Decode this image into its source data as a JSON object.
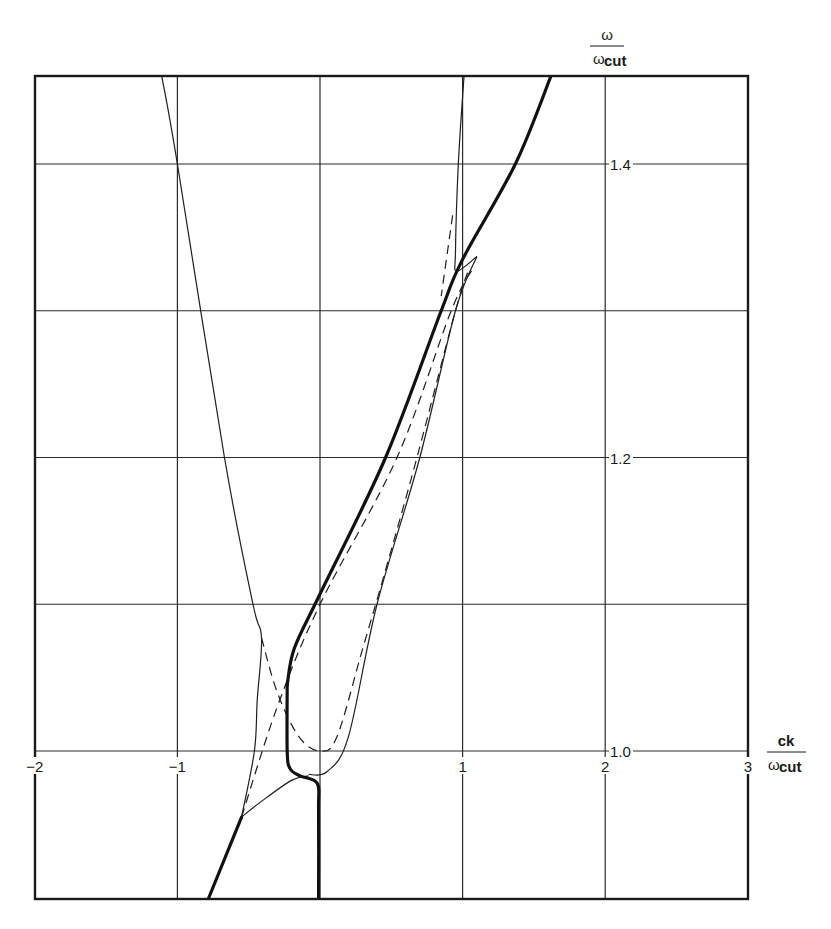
{
  "chart_data": {
    "type": "line",
    "title": "",
    "xlabel": "ck / ω_cut",
    "ylabel": "ω / ω_cut",
    "xlabel_parts": {
      "numerator": "ck",
      "denominator_symbol": "ω",
      "denominator_sub": "cut"
    },
    "ylabel_parts": {
      "numerator": "ω",
      "denominator_symbol": "ω",
      "denominator_sub": "cut"
    },
    "xlim": [
      -2,
      3
    ],
    "ylim": [
      0.9,
      1.46
    ],
    "grid": true,
    "x_ticks": [
      {
        "value": -2,
        "label": "−2"
      },
      {
        "value": -1,
        "label": "−1"
      },
      {
        "value": 0,
        "label": ""
      },
      {
        "value": 1,
        "label": "1"
      },
      {
        "value": 2,
        "label": "2"
      },
      {
        "value": 3,
        "label": "3"
      }
    ],
    "y_ticks": [
      {
        "value": 1.0,
        "label": "1.0"
      },
      {
        "value": 1.1,
        "label": ""
      },
      {
        "value": 1.2,
        "label": "1.2"
      },
      {
        "value": 1.3,
        "label": ""
      },
      {
        "value": 1.4,
        "label": "1.4"
      }
    ],
    "legend": null,
    "series": [
      {
        "name": "thick branch (upper light line)",
        "style": "thick",
        "points": [
          [
            -0.23,
            1.045
          ],
          [
            -0.18,
            1.07
          ],
          [
            0.0,
            1.107
          ],
          [
            0.46,
            1.2
          ],
          [
            0.85,
            1.3
          ],
          [
            1.0,
            1.335
          ],
          [
            1.37,
            1.4
          ],
          [
            1.62,
            1.46
          ]
        ]
      },
      {
        "name": "thick branch (lower-left light line)",
        "style": "thick",
        "points": [
          [
            -0.78,
            0.9
          ],
          [
            -0.55,
            0.955
          ]
        ]
      },
      {
        "name": "thick branch (near-vertical through origin)",
        "style": "thick",
        "points": [
          [
            -0.23,
            1.045
          ],
          [
            -0.23,
            1.0
          ],
          [
            -0.21,
            0.988
          ],
          [
            -0.14,
            0.983
          ],
          [
            -0.02,
            0.978
          ],
          [
            -0.01,
            0.96
          ],
          [
            -0.01,
            0.9
          ]
        ]
      },
      {
        "name": "thin left branch",
        "style": "thin",
        "points": [
          [
            -1.11,
            1.46
          ],
          [
            -1.0,
            1.4
          ],
          [
            -0.67,
            1.2
          ],
          [
            -0.47,
            1.1
          ],
          [
            -0.41,
            1.077
          ],
          [
            -0.44,
            1.035
          ],
          [
            -0.46,
            1.0
          ],
          [
            -0.55,
            0.955
          ]
        ]
      },
      {
        "name": "thin lower connector",
        "style": "thin",
        "points": [
          [
            -0.55,
            0.955
          ],
          [
            -0.42,
            0.965
          ],
          [
            -0.2,
            0.98
          ],
          [
            -0.08,
            0.983
          ]
        ]
      },
      {
        "name": "thin right loop",
        "style": "thin",
        "points": [
          [
            -0.08,
            0.984
          ],
          [
            0.05,
            0.986
          ],
          [
            0.2,
            1.01
          ],
          [
            0.4,
            1.1
          ],
          [
            0.7,
            1.2
          ],
          [
            0.95,
            1.3
          ],
          [
            1.1,
            1.337
          ]
        ]
      },
      {
        "name": "thin upper branch near ck=1",
        "style": "thin",
        "points": [
          [
            1.01,
            1.46
          ],
          [
            0.97,
            1.4
          ],
          [
            0.95,
            1.34
          ],
          [
            0.96,
            1.327
          ],
          [
            1.1,
            1.337
          ]
        ]
      },
      {
        "name": "dashed straight light line",
        "style": "dashed",
        "points": [
          [
            -0.55,
            0.955
          ],
          [
            -0.3,
            1.03
          ],
          [
            0.0,
            1.1
          ],
          [
            0.54,
            1.2
          ],
          [
            0.92,
            1.3
          ],
          [
            1.08,
            1.33
          ]
        ]
      },
      {
        "name": "dashed parabola",
        "style": "dashed",
        "points": [
          [
            -0.41,
            1.077
          ],
          [
            -0.3,
            1.04
          ],
          [
            -0.15,
            1.01
          ],
          [
            0.0,
            1.0
          ],
          [
            0.12,
            1.01
          ],
          [
            0.3,
            1.07
          ],
          [
            0.45,
            1.12
          ],
          [
            0.68,
            1.2
          ],
          [
            0.95,
            1.3
          ],
          [
            1.05,
            1.33
          ]
        ]
      },
      {
        "name": "dashed upper segment",
        "style": "dashed",
        "points": [
          [
            0.93,
            1.365
          ],
          [
            0.85,
            1.31
          ]
        ]
      }
    ]
  }
}
